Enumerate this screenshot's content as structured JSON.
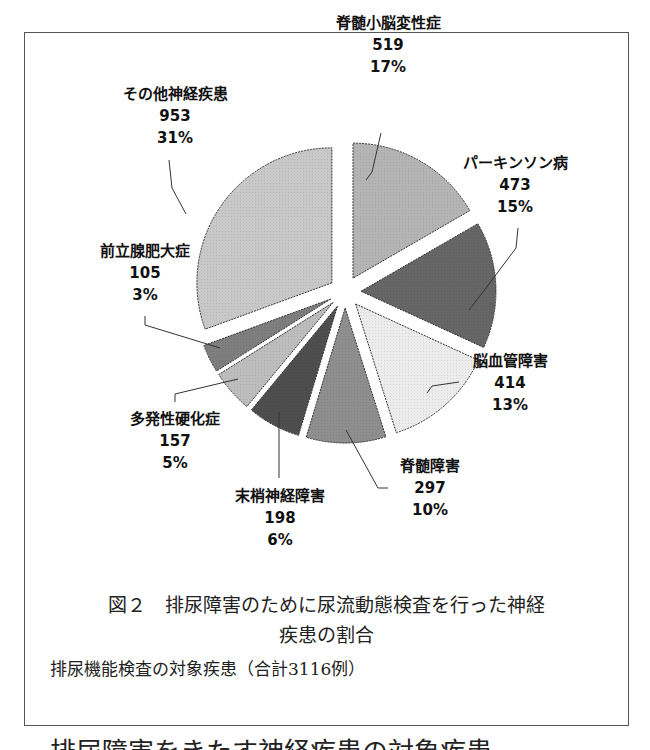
{
  "chart_data": {
    "type": "pie",
    "subtitle": "排尿機能検査の対象疾患（合計3116例）",
    "total": 3116,
    "exploded": true,
    "legend": "none (data labels on slices)",
    "slices": [
      {
        "label": "脊髄小脳変性症",
        "value": 519,
        "percent": "17%",
        "color": "#b4b4b4"
      },
      {
        "label": "パーキンソン病",
        "value": 473,
        "percent": "15%",
        "color": "#666666"
      },
      {
        "label": "脳血管障害",
        "value": 414,
        "percent": "13%",
        "color": "#ececec"
      },
      {
        "label": "脊髄障害",
        "value": 297,
        "percent": "10%",
        "color": "#8e8e8e"
      },
      {
        "label": "末梢神経障害",
        "value": 198,
        "percent": "6%",
        "color": "#4e4e4e"
      },
      {
        "label": "多発性硬化症",
        "value": 157,
        "percent": "5%",
        "color": "#bdbdbd"
      },
      {
        "label": "前立腺肥大症",
        "value": 105,
        "percent": "3%",
        "color": "#7e7e7e"
      },
      {
        "label": "その他神経疾患",
        "value": 953,
        "percent": "31%",
        "color": "#c8c8c8"
      }
    ]
  },
  "labels": {
    "scd": {
      "name": "脊髄小脳変性症",
      "value": "519",
      "pct": "17%"
    },
    "pd": {
      "name": "パーキンソン病",
      "value": "473",
      "pct": "15%"
    },
    "cvd": {
      "name": "脳血管障害",
      "value": "414",
      "pct": "13%"
    },
    "spinal": {
      "name": "脊髄障害",
      "value": "297",
      "pct": "10%"
    },
    "peripheral": {
      "name": "末梢神経障害",
      "value": "198",
      "pct": "6%"
    },
    "ms": {
      "name": "多発性硬化症",
      "value": "157",
      "pct": "5%"
    },
    "bph": {
      "name": "前立腺肥大症",
      "value": "105",
      "pct": "3%"
    },
    "other": {
      "name": "その他神経疾患",
      "value": "953",
      "pct": "31%"
    }
  },
  "caption": {
    "line1": "図２　排尿障害のために尿流動態検査を行った神経",
    "line2": "疾患の割合",
    "sub": "排尿機能検査の対象疾患（合計3116例）"
  },
  "cutoff_text": "排尿障害をきたす神経疾患の対象疾患"
}
